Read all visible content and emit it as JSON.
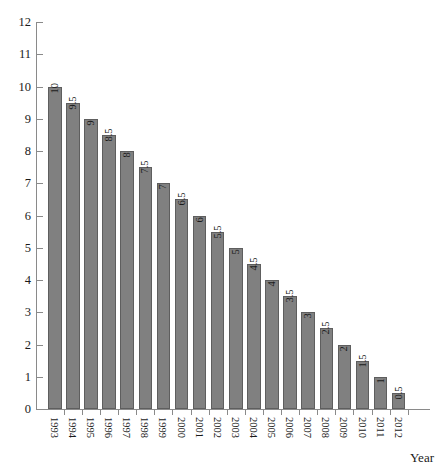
{
  "chart_data": {
    "type": "bar",
    "title": "",
    "subtitle": "",
    "xlabel": "Year",
    "ylabel": "",
    "categories": [
      "1993",
      "1994",
      "1995",
      "1996",
      "1997",
      "1998",
      "1999",
      "2000",
      "2001",
      "2002",
      "2003",
      "2004",
      "2005",
      "2006",
      "2007",
      "2008",
      "2009",
      "2010",
      "2011",
      "2012"
    ],
    "values": [
      10,
      9.5,
      9,
      8.5,
      8,
      7.5,
      7,
      6.5,
      6,
      5.5,
      5,
      4.5,
      4,
      3.5,
      3,
      2.5,
      2,
      1.5,
      1,
      0.5
    ],
    "value_labels": [
      "10",
      "9.5",
      "9",
      "8.5",
      "8",
      "7.5",
      "7",
      "6.5",
      "6",
      "5.5",
      "5",
      "4.5",
      "4",
      "3.5",
      "3",
      "2.5",
      "2",
      "1.5",
      "1",
      "0.5"
    ],
    "ylim": [
      0,
      12
    ],
    "y_ticks": [
      0,
      1,
      2,
      3,
      4,
      5,
      6,
      7,
      8,
      9,
      10,
      11,
      12
    ],
    "y_tick_labels": [
      "0",
      "1",
      "2",
      "3",
      "4",
      "5",
      "6",
      "7",
      "8",
      "9",
      "10",
      "11",
      "12"
    ],
    "grid": false,
    "legend": null,
    "bar_color": "#808080",
    "bar_edge_color": "#5e5e5e",
    "axis_color": "#8a8a8a",
    "text_color": "#1a1a1a",
    "background": "#ffffff",
    "x_tick_label_rotation": 90,
    "value_label_rotation": 90
  }
}
